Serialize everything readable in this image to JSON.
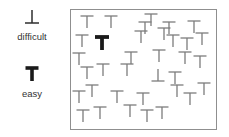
{
  "colors": {
    "background": "#ffffff",
    "distractor": "#7c7c7c",
    "easy_target": "#1a1a1a",
    "legend_symbol": "#2e2e2e",
    "box_border": "#8f8f8f",
    "label_text": "#333333"
  },
  "legend": {
    "difficult": {
      "label": "difficult",
      "icon": "inverted-t-icon"
    },
    "easy": {
      "label": "easy",
      "icon": "bold-t-icon"
    }
  },
  "stimulus_field": {
    "box": {
      "left": 70,
      "top": 9,
      "width": 145,
      "height": 119
    },
    "items": [
      {
        "kind": "T",
        "cx": 16,
        "ty": 6
      },
      {
        "kind": "T",
        "cx": 40,
        "ty": 6
      },
      {
        "kind": "T",
        "cx": 80,
        "ty": 4
      },
      {
        "kind": "T",
        "cx": 74,
        "ty": 12
      },
      {
        "kind": "T",
        "cx": 98,
        "ty": 12
      },
      {
        "kind": "T",
        "cx": 123,
        "ty": 11
      },
      {
        "kind": "T",
        "cx": 11,
        "ty": 25
      },
      {
        "kind": "boldT",
        "cx": 31,
        "ty": 27
      },
      {
        "kind": "T",
        "cx": 70,
        "ty": 21
      },
      {
        "kind": "T",
        "cx": 93,
        "ty": 18
      },
      {
        "kind": "T",
        "cx": 102,
        "ty": 25
      },
      {
        "kind": "T",
        "cx": 116,
        "ty": 28
      },
      {
        "kind": "T",
        "cx": 131,
        "ty": 23
      },
      {
        "kind": "T",
        "cx": 8,
        "ty": 43
      },
      {
        "kind": "T",
        "cx": 60,
        "ty": 42
      },
      {
        "kind": "T",
        "cx": 88,
        "ty": 40
      },
      {
        "kind": "T",
        "cx": 114,
        "ty": 42
      },
      {
        "kind": "T",
        "cx": 129,
        "ty": 46
      },
      {
        "kind": "T",
        "cx": 16,
        "ty": 57
      },
      {
        "kind": "T",
        "cx": 32,
        "ty": 54
      },
      {
        "kind": "T",
        "cx": 56,
        "ty": 54
      },
      {
        "kind": "invT",
        "cx": 87,
        "ty": 59
      },
      {
        "kind": "T",
        "cx": 104,
        "ty": 62
      },
      {
        "kind": "T",
        "cx": 21,
        "ty": 75
      },
      {
        "kind": "T",
        "cx": 8,
        "ty": 81
      },
      {
        "kind": "T",
        "cx": 46,
        "ty": 81
      },
      {
        "kind": "T",
        "cx": 72,
        "ty": 83
      },
      {
        "kind": "T",
        "cx": 106,
        "ty": 75
      },
      {
        "kind": "T",
        "cx": 119,
        "ty": 83
      },
      {
        "kind": "T",
        "cx": 133,
        "ty": 73
      },
      {
        "kind": "T",
        "cx": 12,
        "ty": 100
      },
      {
        "kind": "T",
        "cx": 29,
        "ty": 97
      },
      {
        "kind": "T",
        "cx": 59,
        "ty": 95
      },
      {
        "kind": "T",
        "cx": 76,
        "ty": 100
      },
      {
        "kind": "T",
        "cx": 91,
        "ty": 97
      }
    ]
  }
}
